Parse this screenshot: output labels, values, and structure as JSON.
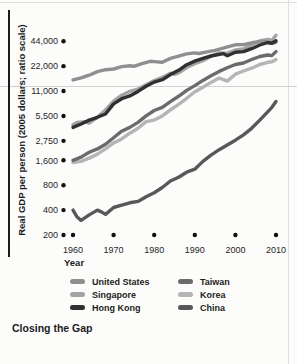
{
  "figure": {
    "caption": "Closing the Gap"
  },
  "chart_data": {
    "type": "line",
    "title": "Closing the Gap",
    "xlabel": "Year",
    "ylabel": "Real GDP per person (2005 dollars; ratio scale)",
    "y_scale": "log",
    "grid": "single light rule at 11,000 level",
    "legend_position": "below-chart, two columns",
    "xlim": [
      1960,
      2010
    ],
    "ylim": [
      200,
      44000
    ],
    "x_ticks": [
      1960,
      1970,
      1980,
      1990,
      2000,
      2010
    ],
    "x_tick_labels": [
      "1960",
      "1970",
      "1980",
      "1990",
      "2000",
      "2010"
    ],
    "y_ticks": [
      44000,
      22000,
      11000,
      5500,
      2750,
      1600,
      800,
      400,
      200
    ],
    "y_tick_labels": [
      "44,000",
      "22,000",
      "11,000",
      "5,500",
      "2,750",
      "1,600",
      "800",
      "400",
      "200"
    ],
    "tick_marker": "filled-dot",
    "legend": [
      {
        "label": "United States",
        "color": "#8f8f8f"
      },
      {
        "label": "Singapore",
        "color": "#a3a3a3"
      },
      {
        "label": "Hong Kong",
        "color": "#303030"
      },
      {
        "label": "Taiwan",
        "color": "#6b6b6b"
      },
      {
        "label": "Korea",
        "color": "#b5b5b5"
      },
      {
        "label": "China",
        "color": "#585858"
      }
    ],
    "series": [
      {
        "id": "korea",
        "name": "Korea",
        "color": "#b5b5b5",
        "points": [
          [
            1960,
            1500
          ],
          [
            1962,
            1550
          ],
          [
            1964,
            1700
          ],
          [
            1966,
            1900
          ],
          [
            1968,
            2200
          ],
          [
            1970,
            2600
          ],
          [
            1972,
            2900
          ],
          [
            1974,
            3400
          ],
          [
            1976,
            3900
          ],
          [
            1978,
            4700
          ],
          [
            1980,
            4900
          ],
          [
            1982,
            5500
          ],
          [
            1984,
            6500
          ],
          [
            1986,
            7600
          ],
          [
            1988,
            9000
          ],
          [
            1990,
            10800
          ],
          [
            1992,
            12200
          ],
          [
            1994,
            14000
          ],
          [
            1996,
            15800
          ],
          [
            1998,
            14500
          ],
          [
            2000,
            17600
          ],
          [
            2002,
            19200
          ],
          [
            2004,
            20800
          ],
          [
            2006,
            23000
          ],
          [
            2008,
            24500
          ],
          [
            2009,
            24800
          ],
          [
            2010,
            26500
          ]
        ]
      },
      {
        "id": "singapore",
        "name": "Singapore",
        "color": "#a3a3a3",
        "points": [
          [
            1960,
            4300
          ],
          [
            1961,
            4600
          ],
          [
            1963,
            4700
          ],
          [
            1964,
            4500
          ],
          [
            1966,
            5300
          ],
          [
            1968,
            6500
          ],
          [
            1970,
            8300
          ],
          [
            1972,
            9800
          ],
          [
            1974,
            10900
          ],
          [
            1976,
            11600
          ],
          [
            1978,
            13100
          ],
          [
            1980,
            14700
          ],
          [
            1982,
            16100
          ],
          [
            1984,
            18100
          ],
          [
            1985,
            17500
          ],
          [
            1986,
            18200
          ],
          [
            1988,
            21200
          ],
          [
            1990,
            23600
          ],
          [
            1992,
            25600
          ],
          [
            1994,
            29000
          ],
          [
            1996,
            31800
          ],
          [
            1998,
            31500
          ],
          [
            2000,
            34500
          ],
          [
            2002,
            35500
          ],
          [
            2004,
            40000
          ],
          [
            2006,
            44500
          ],
          [
            2008,
            46500
          ],
          [
            2009,
            45000
          ],
          [
            2010,
            52000
          ]
        ]
      },
      {
        "id": "united-states",
        "name": "United States",
        "color": "#8f8f8f",
        "points": [
          [
            1960,
            15000
          ],
          [
            1962,
            15900
          ],
          [
            1964,
            17100
          ],
          [
            1966,
            18900
          ],
          [
            1968,
            19900
          ],
          [
            1970,
            20300
          ],
          [
            1972,
            21700
          ],
          [
            1974,
            22200
          ],
          [
            1975,
            21900
          ],
          [
            1977,
            23600
          ],
          [
            1979,
            25200
          ],
          [
            1980,
            25000
          ],
          [
            1982,
            24500
          ],
          [
            1984,
            27300
          ],
          [
            1986,
            29000
          ],
          [
            1988,
            30900
          ],
          [
            1990,
            31800
          ],
          [
            1991,
            31300
          ],
          [
            1993,
            32700
          ],
          [
            1995,
            34200
          ],
          [
            1997,
            36300
          ],
          [
            1999,
            38700
          ],
          [
            2000,
            39800
          ],
          [
            2002,
            40100
          ],
          [
            2004,
            42100
          ],
          [
            2006,
            43600
          ],
          [
            2007,
            44100
          ],
          [
            2009,
            41500
          ],
          [
            2010,
            42700
          ]
        ]
      },
      {
        "id": "taiwan",
        "name": "Taiwan",
        "color": "#6b6b6b",
        "points": [
          [
            1960,
            1600
          ],
          [
            1962,
            1750
          ],
          [
            1964,
            2000
          ],
          [
            1966,
            2200
          ],
          [
            1968,
            2500
          ],
          [
            1970,
            3000
          ],
          [
            1972,
            3600
          ],
          [
            1974,
            4000
          ],
          [
            1976,
            4600
          ],
          [
            1978,
            5500
          ],
          [
            1980,
            6400
          ],
          [
            1982,
            7000
          ],
          [
            1984,
            8200
          ],
          [
            1986,
            9500
          ],
          [
            1988,
            11200
          ],
          [
            1990,
            12800
          ],
          [
            1992,
            14800
          ],
          [
            1994,
            16800
          ],
          [
            1996,
            19000
          ],
          [
            1998,
            21000
          ],
          [
            2000,
            23000
          ],
          [
            2002,
            24000
          ],
          [
            2004,
            26500
          ],
          [
            2006,
            28800
          ],
          [
            2008,
            30000
          ],
          [
            2009,
            29500
          ],
          [
            2010,
            33000
          ]
        ]
      },
      {
        "id": "china",
        "name": "China",
        "color": "#585858",
        "points": [
          [
            1960,
            400
          ],
          [
            1961,
            330
          ],
          [
            1962,
            300
          ],
          [
            1964,
            350
          ],
          [
            1966,
            400
          ],
          [
            1967,
            380
          ],
          [
            1968,
            355
          ],
          [
            1970,
            430
          ],
          [
            1972,
            460
          ],
          [
            1974,
            490
          ],
          [
            1976,
            510
          ],
          [
            1978,
            580
          ],
          [
            1980,
            650
          ],
          [
            1982,
            750
          ],
          [
            1984,
            900
          ],
          [
            1986,
            1000
          ],
          [
            1988,
            1150
          ],
          [
            1990,
            1250
          ],
          [
            1992,
            1550
          ],
          [
            1994,
            1850
          ],
          [
            1996,
            2150
          ],
          [
            1998,
            2450
          ],
          [
            2000,
            2800
          ],
          [
            2002,
            3250
          ],
          [
            2004,
            3900
          ],
          [
            2006,
            4900
          ],
          [
            2008,
            6200
          ],
          [
            2009,
            7000
          ],
          [
            2010,
            8200
          ]
        ]
      },
      {
        "id": "hong-kong",
        "name": "Hong Kong",
        "color": "#303030",
        "points": [
          [
            1960,
            4000
          ],
          [
            1962,
            4400
          ],
          [
            1964,
            4900
          ],
          [
            1966,
            5300
          ],
          [
            1968,
            5800
          ],
          [
            1970,
            7700
          ],
          [
            1972,
            8900
          ],
          [
            1974,
            9600
          ],
          [
            1976,
            10900
          ],
          [
            1978,
            12600
          ],
          [
            1980,
            14100
          ],
          [
            1982,
            15100
          ],
          [
            1984,
            17400
          ],
          [
            1986,
            19600
          ],
          [
            1988,
            22900
          ],
          [
            1990,
            25300
          ],
          [
            1992,
            27400
          ],
          [
            1994,
            29200
          ],
          [
            1997,
            31200
          ],
          [
            1998,
            29400
          ],
          [
            2000,
            32400
          ],
          [
            2002,
            33000
          ],
          [
            2004,
            35800
          ],
          [
            2006,
            39600
          ],
          [
            2008,
            42500
          ],
          [
            2009,
            41500
          ],
          [
            2010,
            44500
          ]
        ]
      }
    ]
  }
}
